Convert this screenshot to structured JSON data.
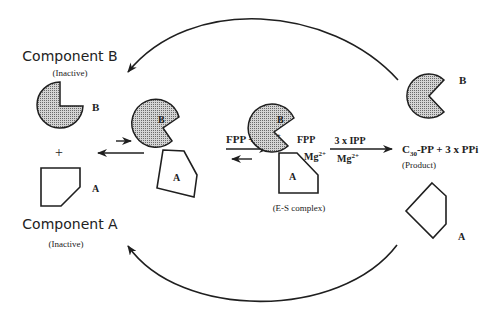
{
  "colors": {
    "stroke": "#1f1f1f",
    "fill_pattern_bg": "#d4d4d4",
    "fill_pattern_dot": "#6a6a6a",
    "text": "#222222"
  },
  "left": {
    "component_b_title": "Component B",
    "component_b_status": "(Inactive)",
    "component_b_label": "B",
    "plus": "+",
    "component_a_title": "Component A",
    "component_a_status": "(Inactive)",
    "component_a_label": "A"
  },
  "complex_inactive": {
    "b_label": "B",
    "a_label": "A"
  },
  "step1": {
    "reagents": "FPP + Mg",
    "reagents_sup": "2+"
  },
  "es_complex": {
    "b_label": "B",
    "a_label": "A",
    "fpp": "FPP",
    "mg": "Mg",
    "mg_sup": "2+",
    "caption": "(E-S complex)"
  },
  "step2": {
    "top": "3 x IPP",
    "bottom": "Mg",
    "bottom_sup": "2+"
  },
  "product": {
    "c": "C",
    "c_sub": "30",
    "rest": "-PP + 3 x PPi",
    "caption": "(Product)"
  },
  "right": {
    "b_label": "B",
    "a_label": "A"
  }
}
